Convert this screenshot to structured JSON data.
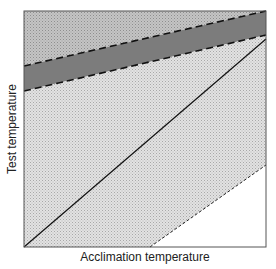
{
  "diagram": {
    "xlabel": "Acclimation temperature",
    "ylabel": "Test temperature",
    "regions": [
      {
        "name": "upper-region",
        "fill": "#b8b8b8",
        "description": "light grey stippled region above upper dashed line"
      },
      {
        "name": "band-region",
        "fill": "#7a7a7a",
        "description": "dark grey band between dashed lines"
      },
      {
        "name": "middle-region",
        "fill": "#d6d6d6",
        "description": "fine stippled region between lower dashed line and short-dashed line"
      },
      {
        "name": "lower-right-region",
        "fill": "#ffffff",
        "description": "white region below short-dashed line"
      }
    ],
    "lines": [
      {
        "name": "upper-dashed-line",
        "style": "long-dash"
      },
      {
        "name": "lower-dashed-line",
        "style": "long-dash"
      },
      {
        "name": "diagonal-solid-line",
        "style": "solid"
      },
      {
        "name": "bottom-short-dashed-line",
        "style": "short-dash"
      }
    ]
  }
}
